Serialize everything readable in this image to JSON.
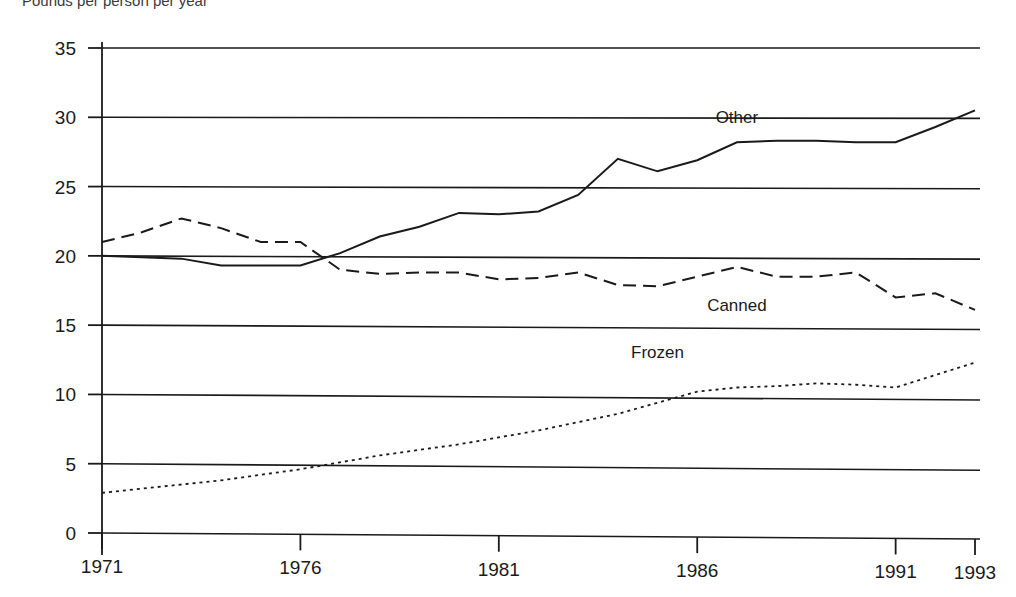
{
  "chart_data": {
    "type": "line",
    "title": "",
    "subtitle": "Pounds per person per year",
    "xlabel": "",
    "ylabel": "",
    "xlim": [
      1971,
      1993
    ],
    "ylim": [
      0,
      35
    ],
    "grid": true,
    "gridlines_axis": "y",
    "legend_position": "inline-labels",
    "y_ticks": [
      0,
      5,
      10,
      15,
      20,
      25,
      30,
      35
    ],
    "y_tick_labels": [
      "0",
      "5",
      "10",
      "15",
      "20",
      "25",
      "30",
      "35"
    ],
    "x_ticks": [
      1971,
      1976,
      1981,
      1986,
      1991,
      1993
    ],
    "x_tick_labels": [
      "1971",
      "1976",
      "1981",
      "1986",
      "1991",
      "1993"
    ],
    "x": [
      1971,
      1972,
      1973,
      1974,
      1975,
      1976,
      1977,
      1978,
      1979,
      1980,
      1981,
      1982,
      1983,
      1984,
      1985,
      1986,
      1987,
      1988,
      1989,
      1990,
      1991,
      1992,
      1993
    ],
    "series": [
      {
        "name": "Other",
        "style": "solid",
        "color": "#1a1a1a",
        "label_x": 1987,
        "label_y": 29.6,
        "values": [
          20.0,
          19.9,
          19.8,
          19.3,
          19.3,
          19.3,
          20.2,
          21.4,
          22.1,
          23.1,
          23.0,
          23.2,
          24.4,
          27.0,
          26.1,
          26.9,
          28.2,
          28.3,
          28.3,
          28.2,
          28.2,
          29.3,
          30.5
        ]
      },
      {
        "name": "Canned",
        "style": "dashed",
        "color": "#1a1a1a",
        "label_x": 1987,
        "label_y": 16.0,
        "values": [
          21.0,
          21.7,
          22.7,
          22.0,
          21.0,
          21.0,
          19.0,
          18.7,
          18.8,
          18.8,
          18.3,
          18.4,
          18.8,
          17.9,
          17.8,
          18.5,
          19.2,
          18.5,
          18.5,
          18.8,
          17.0,
          17.3,
          16.1
        ]
      },
      {
        "name": "Frozen",
        "style": "dotted",
        "color": "#1a1a1a",
        "label_x": 1985,
        "label_y": 12.6,
        "values": [
          2.9,
          3.2,
          3.5,
          3.8,
          4.2,
          4.6,
          5.1,
          5.6,
          6.0,
          6.4,
          6.9,
          7.4,
          8.0,
          8.6,
          9.4,
          10.2,
          10.5,
          10.6,
          10.8,
          10.7,
          10.5,
          11.4,
          12.3
        ]
      }
    ]
  },
  "colors": {
    "axis": "#1a1a1a",
    "grid": "#1a1a1a",
    "background": "#ffffff"
  }
}
